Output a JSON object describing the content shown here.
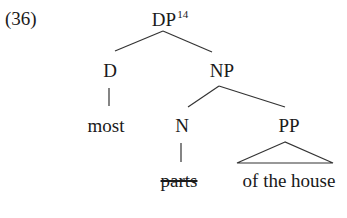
{
  "example_number": "(36)",
  "tree": {
    "root": {
      "label": "DP",
      "superscript": "14",
      "children": [
        "D",
        "NP"
      ]
    },
    "d": {
      "label": "D",
      "terminal": "most"
    },
    "np": {
      "label": "NP",
      "children": [
        "N",
        "PP"
      ]
    },
    "n": {
      "label": "N",
      "terminal": "parts",
      "terminal_struck_through": true
    },
    "pp": {
      "label": "PP",
      "terminal": "of the house",
      "triangle": true
    }
  },
  "colors": {
    "text": "#1a1a1a",
    "lines": "#333333",
    "background": "#ffffff"
  }
}
